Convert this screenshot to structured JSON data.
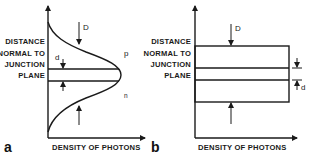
{
  "figure": {
    "panels": [
      {
        "id": "a",
        "panel_label": "a",
        "y_axis_label_lines": [
          "DISTANCE",
          "NORMAL TO",
          "JUNCTION",
          "PLANE"
        ],
        "x_axis_label": "DENSITY OF PHOTONS",
        "profile": "gaussian",
        "region_labels": {
          "top": "p",
          "bottom": "n"
        },
        "markers": {
          "mode_width": "D",
          "junction_width": "d"
        }
      },
      {
        "id": "b",
        "panel_label": "b",
        "y_axis_label_lines": [
          "DISTANCE",
          "NORMAL TO",
          "JUNCTION",
          "PLANE"
        ],
        "x_axis_label": "DENSITY OF PHOTONS",
        "profile": "rectangular",
        "markers": {
          "mode_width": "D",
          "junction_width": "d"
        }
      }
    ],
    "colors": {
      "ink": "#1a1a1a",
      "background": "#ffffff"
    }
  }
}
